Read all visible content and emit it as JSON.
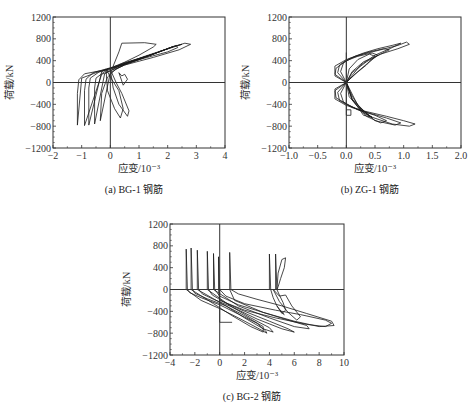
{
  "chart_data": [
    {
      "id": "a",
      "type": "line",
      "caption": "(a) BG-1 钢筋",
      "title": "",
      "xlabel": "应变/10⁻³",
      "ylabel": "荷载/kN",
      "xlim": [
        -2,
        4
      ],
      "ylim": [
        -1200,
        1200
      ],
      "xticks": [
        -2,
        -1,
        0,
        1,
        2,
        3,
        4
      ],
      "yticks": [
        -1200,
        -800,
        -400,
        0,
        400,
        800,
        1200
      ],
      "grid": false,
      "box": {
        "x0": 53,
        "x1": 225,
        "y0": 17,
        "y1": 148
      },
      "series": [
        {
          "name": "loop-1",
          "x": [
            -1.15,
            -1.15,
            -1.1,
            -0.9,
            -0.3,
            0.2,
            1.0,
            1.8,
            2.3,
            2.35,
            2.0,
            1.0,
            0.2,
            -0.5,
            -1.0,
            -1.15
          ],
          "y": [
            -780,
            -200,
            50,
            160,
            220,
            280,
            420,
            580,
            680,
            640,
            560,
            420,
            290,
            180,
            80,
            -780
          ]
        },
        {
          "name": "loop-2",
          "x": [
            -0.9,
            -0.9,
            -0.85,
            -0.6,
            0.0,
            0.8,
            1.6,
            2.1,
            2.6,
            2.8,
            2.4,
            1.5,
            0.5,
            -0.3,
            -0.9
          ],
          "y": [
            -790,
            -150,
            60,
            180,
            270,
            400,
            540,
            640,
            720,
            700,
            600,
            460,
            320,
            150,
            -790
          ]
        },
        {
          "name": "loop-3",
          "x": [
            -0.55,
            -0.55,
            -0.5,
            -0.2,
            0.3,
            1.0,
            1.7,
            2.2,
            2.0,
            1.2,
            0.4,
            -0.2,
            -0.55
          ],
          "y": [
            -760,
            -100,
            80,
            200,
            300,
            430,
            560,
            660,
            620,
            480,
            330,
            160,
            -760
          ]
        },
        {
          "name": "loop-4",
          "x": [
            -0.35,
            -0.3,
            -0.1,
            0.2,
            0.5,
            1.0,
            1.8,
            2.5,
            2.2,
            1.4,
            0.6,
            0.0,
            -0.35
          ],
          "y": [
            -700,
            -200,
            100,
            250,
            320,
            420,
            580,
            700,
            660,
            500,
            360,
            180,
            -700
          ]
        },
        {
          "name": "loop-5",
          "x": [
            -0.75,
            -0.75,
            -0.7,
            -0.4,
            0.1,
            0.9,
            1.5,
            1.2,
            0.4,
            -0.3,
            -0.75
          ],
          "y": [
            -780,
            -100,
            80,
            190,
            280,
            420,
            520,
            470,
            350,
            200,
            -780
          ]
        },
        {
          "name": "loop-6",
          "x": [
            0.0,
            0.1,
            0.3,
            0.6,
            0.65,
            0.4,
            0.2,
            0.0
          ],
          "y": [
            240,
            -100,
            -400,
            -620,
            -520,
            -200,
            0,
            240
          ]
        },
        {
          "name": "loop-7",
          "x": [
            -0.15,
            -0.1,
            0.15,
            0.35,
            0.45,
            0.3,
            0.0,
            -0.15
          ],
          "y": [
            250,
            -150,
            -480,
            -650,
            -480,
            -150,
            100,
            250
          ]
        },
        {
          "name": "top-plateau",
          "x": [
            0.1,
            0.3,
            0.4,
            1.2,
            1.6,
            1.5,
            1.0,
            0.3
          ],
          "y": [
            300,
            560,
            720,
            730,
            700,
            650,
            500,
            320
          ]
        },
        {
          "name": "small-hook",
          "x": [
            0.3,
            0.45,
            0.6,
            0.5,
            0.4,
            0.3
          ],
          "y": [
            180,
            -50,
            60,
            150,
            120,
            180
          ]
        }
      ]
    },
    {
      "id": "b",
      "type": "line",
      "caption": "(b) ZG-1 钢筋",
      "title": "",
      "xlabel": "应变/10⁻³",
      "ylabel": "荷载/kN",
      "xlim": [
        -1.0,
        2.0
      ],
      "ylim": [
        -1200,
        1200
      ],
      "xticks": [
        -1.0,
        -0.5,
        0.0,
        0.5,
        1.0,
        1.5,
        2.0
      ],
      "yticks": [
        -1200,
        -800,
        -400,
        0,
        400,
        800,
        1200
      ],
      "grid": false,
      "box": {
        "x0": 289,
        "x1": 461,
        "y0": 17,
        "y1": 148
      },
      "series": [
        {
          "name": "upper-loop-1",
          "x": [
            0.0,
            -0.2,
            -0.2,
            0.0,
            0.3,
            0.6,
            0.9,
            1.05,
            1.1,
            0.9,
            0.6,
            0.3,
            0.1,
            0.0
          ],
          "y": [
            0,
            150,
            300,
            420,
            520,
            600,
            680,
            740,
            700,
            620,
            520,
            380,
            200,
            0
          ]
        },
        {
          "name": "upper-loop-2",
          "x": [
            0.0,
            -0.15,
            -0.12,
            0.05,
            0.3,
            0.55,
            0.8,
            0.95,
            0.8,
            0.5,
            0.25,
            0.0
          ],
          "y": [
            0,
            180,
            320,
            440,
            540,
            620,
            680,
            720,
            640,
            500,
            320,
            0
          ]
        },
        {
          "name": "upper-loop-3",
          "x": [
            0.0,
            -0.1,
            -0.05,
            0.15,
            0.4,
            0.65,
            0.75,
            0.6,
            0.35,
            0.1,
            0.0
          ],
          "y": [
            0,
            200,
            360,
            480,
            560,
            620,
            600,
            520,
            380,
            180,
            0
          ]
        },
        {
          "name": "upper-loop-4",
          "x": [
            0.0,
            -0.2,
            -0.18,
            0.0,
            0.2,
            0.45,
            0.55,
            0.4,
            0.2,
            0.0
          ],
          "y": [
            0,
            120,
            260,
            400,
            480,
            540,
            500,
            380,
            200,
            0
          ]
        },
        {
          "name": "upper-loop-5",
          "x": [
            0.0,
            0.05,
            0.2,
            0.4,
            0.5,
            0.35,
            0.15,
            0.0
          ],
          "y": [
            0,
            250,
            420,
            520,
            480,
            320,
            150,
            0
          ]
        },
        {
          "name": "lower-loop-1",
          "x": [
            0.0,
            -0.2,
            -0.2,
            0.0,
            0.3,
            0.7,
            1.0,
            1.2,
            1.1,
            0.8,
            0.4,
            0.1,
            0.0
          ],
          "y": [
            0,
            -150,
            -300,
            -420,
            -520,
            -620,
            -700,
            -760,
            -800,
            -760,
            -620,
            -300,
            0
          ]
        },
        {
          "name": "lower-loop-2",
          "x": [
            0.0,
            -0.15,
            -0.12,
            0.1,
            0.4,
            0.7,
            0.95,
            0.85,
            0.5,
            0.2,
            0.0
          ],
          "y": [
            0,
            -180,
            -330,
            -460,
            -560,
            -650,
            -740,
            -780,
            -700,
            -420,
            0
          ]
        },
        {
          "name": "lower-loop-3",
          "x": [
            0.0,
            -0.1,
            -0.05,
            0.2,
            0.5,
            0.7,
            0.6,
            0.35,
            0.1,
            0.0
          ],
          "y": [
            0,
            -200,
            -360,
            -500,
            -600,
            -700,
            -740,
            -620,
            -320,
            0
          ]
        },
        {
          "name": "lower-loop-4",
          "x": [
            0.0,
            -0.2,
            -0.18,
            0.05,
            0.3,
            0.45,
            0.3,
            0.1,
            0.0
          ],
          "y": [
            0,
            -120,
            -280,
            -420,
            -540,
            -640,
            -600,
            -300,
            0
          ]
        },
        {
          "name": "lower-loop-5",
          "x": [
            0.0,
            0.05,
            0.2,
            0.35,
            0.45,
            0.3,
            0.1,
            0.0
          ],
          "y": [
            0,
            -260,
            -440,
            -560,
            -640,
            -560,
            -250,
            0
          ]
        },
        {
          "name": "vertical-spike",
          "x": [
            0.0,
            0.0,
            0.08,
            0.08,
            0.0
          ],
          "y": [
            550,
            -600,
            -600,
            -500,
            -500
          ]
        }
      ]
    },
    {
      "id": "c",
      "type": "line",
      "caption": "(c) BG-2 钢筋",
      "title": "",
      "xlabel": "应变/10⁻³",
      "ylabel": "荷载/kN",
      "xlim": [
        -4,
        10
      ],
      "ylim": [
        -1200,
        1200
      ],
      "xticks": [
        -4,
        -2,
        0,
        2,
        4,
        6,
        8,
        10
      ],
      "yticks": [
        -1200,
        -800,
        -400,
        0,
        400,
        800,
        1200
      ],
      "grid": false,
      "box": {
        "x0": 170,
        "x1": 344,
        "y0": 224,
        "y1": 355
      },
      "series": [
        {
          "name": "spike-1",
          "x": [
            -2.7,
            -2.7,
            -2.6,
            -2.4,
            -1.5,
            0.0,
            1.5,
            3.0,
            3.7,
            3.8,
            3.0,
            1.5,
            0.0,
            -1.5,
            -2.7
          ],
          "y": [
            0,
            740,
            0,
            -60,
            -150,
            -280,
            -450,
            -620,
            -760,
            -800,
            -700,
            -520,
            -350,
            -200,
            0
          ]
        },
        {
          "name": "spike-2",
          "x": [
            -2.3,
            -2.3,
            -2.2,
            -2.0,
            -1.0,
            0.5,
            2.0,
            3.5,
            3.5,
            2.5,
            1.0,
            -0.5,
            -2.3
          ],
          "y": [
            0,
            760,
            0,
            -70,
            -170,
            -300,
            -480,
            -680,
            -780,
            -680,
            -480,
            -260,
            0
          ]
        },
        {
          "name": "spike-3",
          "x": [
            -1.8,
            -1.8,
            -1.7,
            -1.4,
            -0.5,
            1.0,
            2.5,
            4.0,
            4.3,
            3.5,
            2.0,
            0.5,
            -1.8
          ],
          "y": [
            0,
            720,
            0,
            -80,
            -180,
            -320,
            -520,
            -700,
            -780,
            -720,
            -520,
            -300,
            0
          ]
        },
        {
          "name": "spike-4",
          "x": [
            -1.0,
            -1.0,
            -0.9,
            -0.6,
            0.5,
            2.0,
            4.0,
            5.5,
            6.0,
            5.0,
            3.0,
            1.0,
            -1.0
          ],
          "y": [
            0,
            700,
            0,
            -100,
            -250,
            -400,
            -580,
            -720,
            -780,
            -720,
            -540,
            -320,
            0
          ]
        },
        {
          "name": "spike-5",
          "x": [
            -0.5,
            -0.5,
            -0.4,
            0.0,
            1.5,
            3.5,
            5.5,
            7.0,
            7.2,
            6.0,
            4.0,
            1.5,
            -0.5
          ],
          "y": [
            0,
            660,
            0,
            -120,
            -280,
            -420,
            -560,
            -660,
            -720,
            -680,
            -520,
            -300,
            0
          ]
        },
        {
          "name": "spike-6",
          "x": [
            -0.1,
            -0.1,
            0.0,
            0.5,
            2.0,
            4.5,
            6.5,
            8.5,
            9.0,
            8.5,
            7.0,
            4.5,
            2.0,
            0.0,
            -0.1
          ],
          "y": [
            0,
            600,
            0,
            -120,
            -260,
            -380,
            -460,
            -560,
            -620,
            -680,
            -640,
            -520,
            -380,
            -200,
            0
          ]
        },
        {
          "name": "spike-7",
          "x": [
            0.8,
            0.8,
            0.9,
            1.5,
            3.0,
            5.0,
            7.0,
            9.0,
            9.2,
            8.0,
            6.0,
            3.5,
            1.2,
            0.8
          ],
          "y": [
            0,
            680,
            0,
            -80,
            -180,
            -300,
            -440,
            -580,
            -660,
            -680,
            -580,
            -420,
            -200,
            0
          ]
        },
        {
          "name": "box-lower",
          "x": [
            0.0,
            0.0,
            1.0,
            1.0
          ],
          "y": [
            0,
            -600,
            -600,
            -600
          ]
        },
        {
          "name": "right-spike-1",
          "x": [
            4.0,
            4.0,
            4.1,
            4.3,
            4.6,
            5.0,
            5.2,
            4.9
          ],
          "y": [
            0,
            650,
            0,
            -150,
            -300,
            -420,
            -460,
            -400
          ]
        },
        {
          "name": "right-spike-2",
          "x": [
            4.5,
            4.5,
            4.6,
            4.8,
            5.1,
            5.3,
            5.0,
            4.6
          ],
          "y": [
            0,
            650,
            0,
            -100,
            -240,
            -380,
            -440,
            -300
          ]
        },
        {
          "name": "right-lobe",
          "x": [
            4.6,
            4.7,
            5.0,
            5.3,
            5.2,
            4.9,
            4.7,
            4.6
          ],
          "y": [
            0,
            300,
            550,
            580,
            400,
            200,
            50,
            0
          ]
        },
        {
          "name": "right-loop-bottom",
          "x": [
            4.3,
            4.8,
            5.3,
            5.8,
            6.5,
            6.2,
            5.5,
            4.8,
            4.3
          ],
          "y": [
            0,
            -120,
            -100,
            -300,
            -500,
            -560,
            -420,
            -220,
            0
          ]
        }
      ]
    }
  ]
}
